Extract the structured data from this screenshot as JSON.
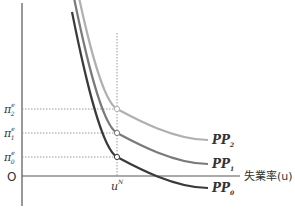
{
  "chart_data": {
    "type": "line",
    "title": "",
    "xlabel": "失業率(u)",
    "ylabel": "",
    "origin_label": "O",
    "natural_rate_label": "u",
    "natural_rate_superscript": "N",
    "y_ticks": [
      {
        "symbol": "π",
        "sup": "e",
        "sub": "2",
        "level": 2
      },
      {
        "symbol": "π",
        "sup": "e",
        "sub": "1",
        "level": 1
      },
      {
        "symbol": "π",
        "sup": "e",
        "sub": "0",
        "level": 0
      }
    ],
    "series": [
      {
        "name": "PP",
        "sub": "2",
        "color": "#b0b0b0",
        "expected_inflation_level": 2
      },
      {
        "name": "PP",
        "sub": "1",
        "color": "#7a7a7a",
        "expected_inflation_level": 1
      },
      {
        "name": "PP",
        "sub": "0",
        "color": "#3a3a3a",
        "expected_inflation_level": 0
      }
    ],
    "colors": {
      "axis": "#555555",
      "guide": "#999999",
      "marker_fill": "#ffffff"
    }
  }
}
